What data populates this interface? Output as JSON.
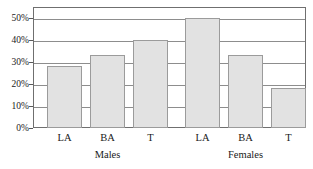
{
  "chart_data": {
    "type": "bar",
    "title": "",
    "subtitle": "",
    "xlabel": "",
    "ylabel": "",
    "ylim": [
      0,
      55
    ],
    "grid": true,
    "legend": false,
    "legend_position": "none",
    "y_ticks": [
      "0%",
      "10%",
      "20%",
      "30%",
      "40%",
      "50%"
    ],
    "y_tick_values": [
      0,
      10,
      20,
      30,
      40,
      50
    ],
    "categories": [
      "LA",
      "BA",
      "T",
      "LA",
      "BA",
      "T"
    ],
    "groups": [
      {
        "name": "Males",
        "categories": [
          "LA",
          "BA",
          "T"
        ],
        "values": [
          28,
          33,
          40
        ]
      },
      {
        "name": "Females",
        "categories": [
          "LA",
          "BA",
          "T"
        ],
        "values": [
          50,
          33,
          18
        ]
      }
    ],
    "values": [
      28,
      33,
      40,
      50,
      33,
      18
    ],
    "bars": [
      {
        "group": "Males",
        "category": "LA",
        "value": 28
      },
      {
        "group": "Males",
        "category": "BA",
        "value": 33
      },
      {
        "group": "Males",
        "category": "T",
        "value": 40
      },
      {
        "group": "Females",
        "category": "LA",
        "value": 50
      },
      {
        "group": "Females",
        "category": "BA",
        "value": 33
      },
      {
        "group": "Females",
        "category": "T",
        "value": 18
      }
    ],
    "colors": {
      "bar_fill": "#e2e2e2",
      "bar_border": "#9b9b9b",
      "gridline": "#8d8d8d",
      "frame": "#6f6f6f",
      "background": "#ffffff",
      "text": "#1a1a1a"
    }
  }
}
